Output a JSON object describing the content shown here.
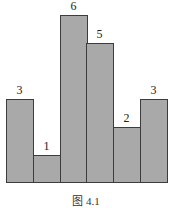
{
  "chart_data": {
    "type": "bar",
    "title": "",
    "caption": "图 4.1",
    "xlabel": "",
    "ylabel": "",
    "categories": [
      "1",
      "2",
      "3",
      "4",
      "5",
      "6"
    ],
    "values": [
      3,
      1,
      6,
      5,
      2,
      3
    ],
    "data_labels": [
      "3",
      "1",
      "6",
      "5",
      "2",
      "3"
    ],
    "ylim": [
      0,
      6
    ],
    "grid": false,
    "axes_visible": false,
    "bar_color": "#a9a9a9",
    "edge_color": "#3c3c3c",
    "bar_gap": 0
  }
}
